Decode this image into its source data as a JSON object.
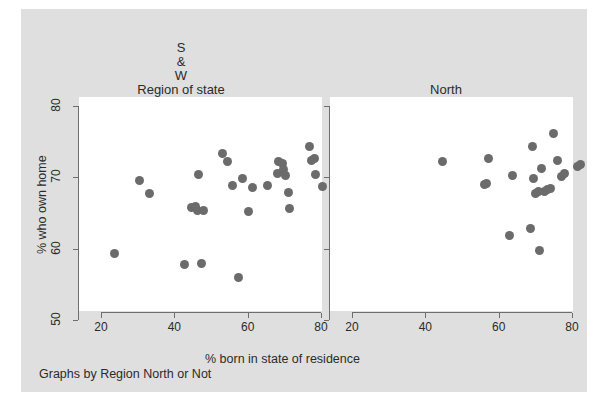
{
  "figure": {
    "caption": "Graphs by Region North or Not",
    "xlabel": "% born in state of residence",
    "ylabel": "% who own home",
    "background_color": "#dfdfdf",
    "plot_color": "#ffffff",
    "marker_color": "#6b6b6b",
    "axis_color": "#6e6e6e"
  },
  "panels": [
    {
      "title": "S\n&\nW\nRegion of state",
      "title_lines": [
        "S",
        "&",
        "W",
        "Region of state"
      ]
    },
    {
      "title": "North\nRegion of state",
      "title_lines": [
        "North",
        "Region of state"
      ]
    }
  ],
  "axis": {
    "xticks": [
      20,
      40,
      60,
      80
    ],
    "xtick_labels": [
      "20",
      "40",
      "60",
      "80"
    ],
    "yticks": [
      50,
      60,
      70,
      80
    ],
    "ytick_labels": [
      "50",
      "60",
      "70",
      "80"
    ],
    "xlim": [
      18,
      84
    ],
    "ylim": [
      48,
      81
    ]
  },
  "chart_data": {
    "type": "scatter",
    "title": "",
    "xlabel": "% born in state of residence",
    "ylabel": "% who own home",
    "xlim": [
      18,
      84
    ],
    "ylim": [
      48,
      81
    ],
    "grid": false,
    "legend": null,
    "facets": [
      {
        "name": "S & W",
        "panel_title": "S\n&\nW\nRegion of state",
        "points": [
          {
            "x": 23.6,
            "y": 59.3
          },
          {
            "x": 30.6,
            "y": 69.6
          },
          {
            "x": 33.2,
            "y": 67.8
          },
          {
            "x": 42.8,
            "y": 57.8
          },
          {
            "x": 44.6,
            "y": 65.8
          },
          {
            "x": 45.8,
            "y": 65.9
          },
          {
            "x": 46.2,
            "y": 65.4
          },
          {
            "x": 46.6,
            "y": 70.4
          },
          {
            "x": 47.4,
            "y": 57.9
          },
          {
            "x": 48.0,
            "y": 65.3
          },
          {
            "x": 53.0,
            "y": 73.3
          },
          {
            "x": 54.4,
            "y": 72.2
          },
          {
            "x": 55.8,
            "y": 68.8
          },
          {
            "x": 57.6,
            "y": 55.9
          },
          {
            "x": 58.6,
            "y": 69.9
          },
          {
            "x": 60.2,
            "y": 65.2
          },
          {
            "x": 61.4,
            "y": 68.6
          },
          {
            "x": 65.4,
            "y": 68.8
          },
          {
            "x": 68.0,
            "y": 70.6
          },
          {
            "x": 68.4,
            "y": 72.2
          },
          {
            "x": 69.4,
            "y": 72.0
          },
          {
            "x": 69.8,
            "y": 71.1
          },
          {
            "x": 70.4,
            "y": 70.2
          },
          {
            "x": 71.2,
            "y": 67.9
          },
          {
            "x": 71.4,
            "y": 65.6
          },
          {
            "x": 76.8,
            "y": 74.3
          },
          {
            "x": 77.4,
            "y": 72.3
          },
          {
            "x": 78.2,
            "y": 72.6
          },
          {
            "x": 78.6,
            "y": 70.4
          },
          {
            "x": 80.4,
            "y": 68.7
          }
        ]
      },
      {
        "name": "North",
        "panel_title": "North\nRegion of state",
        "points": [
          {
            "x": 44.6,
            "y": 72.2
          },
          {
            "x": 56.0,
            "y": 69.0
          },
          {
            "x": 56.8,
            "y": 69.2
          },
          {
            "x": 57.2,
            "y": 72.6
          },
          {
            "x": 63.0,
            "y": 61.9
          },
          {
            "x": 63.8,
            "y": 70.2
          },
          {
            "x": 68.6,
            "y": 62.8
          },
          {
            "x": 69.2,
            "y": 74.3
          },
          {
            "x": 69.6,
            "y": 69.9
          },
          {
            "x": 70.0,
            "y": 67.8
          },
          {
            "x": 70.8,
            "y": 68.0
          },
          {
            "x": 71.2,
            "y": 59.8
          },
          {
            "x": 71.8,
            "y": 71.3
          },
          {
            "x": 72.4,
            "y": 68.0
          },
          {
            "x": 73.2,
            "y": 68.3
          },
          {
            "x": 74.2,
            "y": 68.4
          },
          {
            "x": 75.0,
            "y": 76.1
          },
          {
            "x": 76.0,
            "y": 72.4
          },
          {
            "x": 77.2,
            "y": 70.1
          },
          {
            "x": 78.0,
            "y": 70.5
          },
          {
            "x": 81.4,
            "y": 71.5
          },
          {
            "x": 82.2,
            "y": 71.8
          }
        ]
      }
    ]
  }
}
